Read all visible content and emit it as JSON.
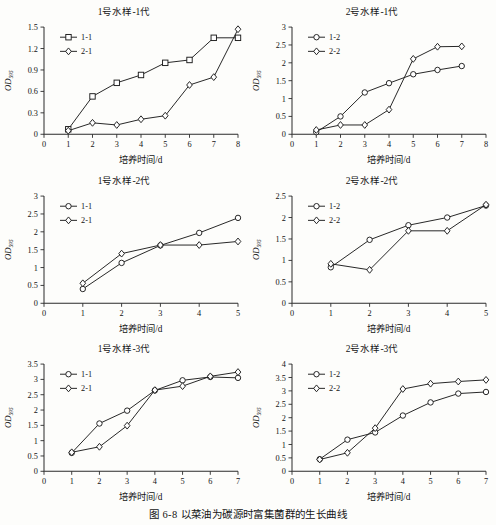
{
  "caption": "图 6-8   以菜油为碳源时富集菌群的生长曲线",
  "common": {
    "xlabel": "培养时间/d",
    "ylabel": "OD",
    "ylabel_sub": "595"
  },
  "chart_data": [
    {
      "id": "panel-1",
      "type": "line",
      "title": "1号水样-1代",
      "xlabel": "培养时间/d",
      "ylabel": "OD595",
      "xlim": [
        0,
        8
      ],
      "ylim": [
        0,
        1.5
      ],
      "xticks": [
        0,
        1,
        2,
        3,
        4,
        5,
        6,
        7,
        8
      ],
      "xtick_labels": [
        "0",
        "1",
        "2",
        "3",
        "4",
        "5",
        "6",
        "7",
        "8"
      ],
      "yticks": [
        0,
        0.3,
        0.6,
        0.9,
        1.2,
        1.5
      ],
      "ytick_labels": [
        "0",
        "0.3",
        "0.6",
        "0.9",
        "1.2",
        "1.5"
      ],
      "grid": false,
      "legend_position": "top-left",
      "series": [
        {
          "name": "1-1",
          "marker": "square",
          "x": [
            1,
            2,
            3,
            4,
            5,
            6,
            7,
            8
          ],
          "values": [
            0.07,
            0.53,
            0.72,
            0.83,
            1.0,
            1.04,
            1.35,
            1.35
          ]
        },
        {
          "name": "2-1",
          "marker": "diamond",
          "x": [
            1,
            2,
            3,
            4,
            5,
            6,
            7,
            8
          ],
          "values": [
            0.05,
            0.16,
            0.13,
            0.21,
            0.26,
            0.69,
            0.8,
            1.47
          ]
        }
      ]
    },
    {
      "id": "panel-2",
      "type": "line",
      "title": "2号水样-1代",
      "xlabel": "培养时间/d",
      "ylabel": "OD595",
      "xlim": [
        0,
        8
      ],
      "ylim": [
        0,
        3
      ],
      "xticks": [
        0,
        1,
        2,
        3,
        4,
        5,
        6,
        7,
        8
      ],
      "xtick_labels": [
        "0",
        "1",
        "2",
        "3",
        "4",
        "5",
        "6",
        "7",
        "8"
      ],
      "yticks": [
        0,
        0.5,
        1,
        1.5,
        2,
        2.5,
        3
      ],
      "ytick_labels": [
        "0",
        "0.5",
        "1",
        "1.5",
        "2",
        "2.5",
        "3"
      ],
      "grid": false,
      "legend_position": "top-left",
      "series": [
        {
          "name": "1-2",
          "marker": "circle",
          "x": [
            1,
            2,
            3,
            4,
            5,
            6,
            7
          ],
          "values": [
            0.06,
            0.5,
            1.17,
            1.43,
            1.68,
            1.8,
            1.91
          ]
        },
        {
          "name": "2-2",
          "marker": "diamond",
          "x": [
            1,
            2,
            3,
            4,
            5,
            6,
            7
          ],
          "values": [
            0.12,
            0.26,
            0.26,
            0.69,
            2.11,
            2.45,
            2.46
          ]
        }
      ]
    },
    {
      "id": "panel-3",
      "type": "line",
      "title": "1号水样-2代",
      "xlabel": "培养时间/d",
      "ylabel": "OD595",
      "xlim": [
        0,
        5
      ],
      "ylim": [
        0,
        3
      ],
      "xticks": [
        0,
        1,
        2,
        3,
        4,
        5
      ],
      "xtick_labels": [
        "0",
        "1",
        "2",
        "3",
        "4",
        "5"
      ],
      "yticks": [
        0,
        0.5,
        1,
        1.5,
        2,
        2.5,
        3
      ],
      "ytick_labels": [
        "0",
        "0.5",
        "1",
        "1.5",
        "2",
        "2.5",
        "3"
      ],
      "grid": false,
      "legend_position": "top-left",
      "series": [
        {
          "name": "1-1",
          "marker": "circle",
          "x": [
            1,
            2,
            3,
            4,
            5
          ],
          "values": [
            0.4,
            1.13,
            1.62,
            1.97,
            2.39
          ]
        },
        {
          "name": "2-1",
          "marker": "diamond",
          "x": [
            1,
            2,
            3,
            4,
            5
          ],
          "values": [
            0.56,
            1.39,
            1.63,
            1.63,
            1.73
          ]
        }
      ]
    },
    {
      "id": "panel-4",
      "type": "line",
      "title": "2号水样-2代",
      "xlabel": "培养时间/d",
      "ylabel": "OD595",
      "xlim": [
        0,
        5
      ],
      "ylim": [
        0,
        2.5
      ],
      "xticks": [
        0,
        1,
        2,
        3,
        4,
        5
      ],
      "xtick_labels": [
        "0",
        "1",
        "2",
        "3",
        "4",
        "5"
      ],
      "yticks": [
        0,
        0.5,
        1,
        1.5,
        2,
        2.5
      ],
      "ytick_labels": [
        "0",
        "0.5",
        "1",
        "1.5",
        "2",
        "2.5"
      ],
      "grid": false,
      "legend_position": "top-left",
      "series": [
        {
          "name": "1-2",
          "marker": "circle",
          "x": [
            1,
            2,
            3,
            4,
            5
          ],
          "values": [
            0.84,
            1.48,
            1.82,
            2.0,
            2.28
          ]
        },
        {
          "name": "2-2",
          "marker": "diamond",
          "x": [
            1,
            2,
            3,
            4,
            5
          ],
          "values": [
            0.92,
            0.78,
            1.69,
            1.69,
            2.3
          ]
        }
      ]
    },
    {
      "id": "panel-5",
      "type": "line",
      "title": "1号水样-3代",
      "xlabel": "培养时间/d",
      "ylabel": "OD595",
      "xlim": [
        0,
        7
      ],
      "ylim": [
        0,
        3.5
      ],
      "xticks": [
        0,
        1,
        2,
        3,
        4,
        5,
        6,
        7
      ],
      "xtick_labels": [
        "0",
        "1",
        "2",
        "3",
        "4",
        "5",
        "6",
        "7"
      ],
      "yticks": [
        0,
        0.5,
        1,
        1.5,
        2,
        2.5,
        3,
        3.5
      ],
      "ytick_labels": [
        "0",
        "0.5",
        "1",
        "1.5",
        "2",
        "2.5",
        "3",
        "3.5"
      ],
      "grid": false,
      "legend_position": "top-left",
      "series": [
        {
          "name": "1-1",
          "marker": "circle",
          "x": [
            1,
            2,
            3,
            4,
            5,
            6,
            7
          ],
          "values": [
            0.6,
            1.56,
            1.98,
            2.64,
            2.97,
            3.08,
            3.05
          ]
        },
        {
          "name": "2-1",
          "marker": "diamond",
          "x": [
            1,
            2,
            3,
            4,
            5,
            6,
            7
          ],
          "values": [
            0.62,
            0.8,
            1.49,
            2.65,
            2.78,
            3.1,
            3.24
          ]
        }
      ]
    },
    {
      "id": "panel-6",
      "type": "line",
      "title": "2号水样-3代",
      "xlabel": "培养时间/d",
      "ylabel": "OD595",
      "xlim": [
        0,
        7
      ],
      "ylim": [
        0,
        4
      ],
      "xticks": [
        0,
        1,
        2,
        3,
        4,
        5,
        6,
        7
      ],
      "xtick_labels": [
        "0",
        "1",
        "2",
        "3",
        "4",
        "5",
        "6",
        "7"
      ],
      "yticks": [
        0,
        0.5,
        1,
        1.5,
        2,
        2.5,
        3,
        3.5,
        4
      ],
      "ytick_labels": [
        "0",
        "0.5",
        "1",
        "1.5",
        "2",
        "2.5",
        "3",
        "3.5",
        "4"
      ],
      "grid": false,
      "legend_position": "top-left",
      "series": [
        {
          "name": "1-2",
          "marker": "circle",
          "x": [
            1,
            2,
            3,
            4,
            5,
            6,
            7
          ],
          "values": [
            0.45,
            1.18,
            1.45,
            2.08,
            2.57,
            2.9,
            2.96
          ]
        },
        {
          "name": "2-2",
          "marker": "diamond",
          "x": [
            1,
            2,
            3,
            4,
            5,
            6,
            7
          ],
          "values": [
            0.44,
            0.69,
            1.61,
            3.07,
            3.27,
            3.35,
            3.41
          ]
        }
      ]
    }
  ]
}
